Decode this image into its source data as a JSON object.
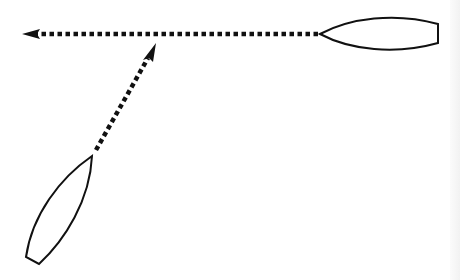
{
  "diagram": {
    "colors": {
      "background": "#ffffff",
      "stroke": "#111111",
      "edge_strip": "#f2f2f2"
    },
    "boats": [
      {
        "id": "boat-upper-right",
        "orientation": "horizontal, bow pointing left",
        "bow": [
          320,
          34
        ],
        "stern_top": [
          438,
          25
        ],
        "stern_bottom": [
          438,
          43
        ]
      },
      {
        "id": "boat-lower-left",
        "orientation": "diagonal, bow pointing up-right",
        "bow": [
          92,
          156
        ],
        "stern_left": [
          26,
          257
        ],
        "stern_right": [
          39,
          264
        ]
      }
    ],
    "paths": [
      {
        "id": "horizontal-path",
        "style": "dotted",
        "from": [
          318,
          34
        ],
        "to": [
          22,
          34
        ],
        "arrowhead": "left"
      },
      {
        "id": "diagonal-path",
        "style": "dotted",
        "from": [
          96,
          150
        ],
        "to": [
          156,
          44
        ],
        "arrowhead": "up-right"
      }
    ]
  }
}
